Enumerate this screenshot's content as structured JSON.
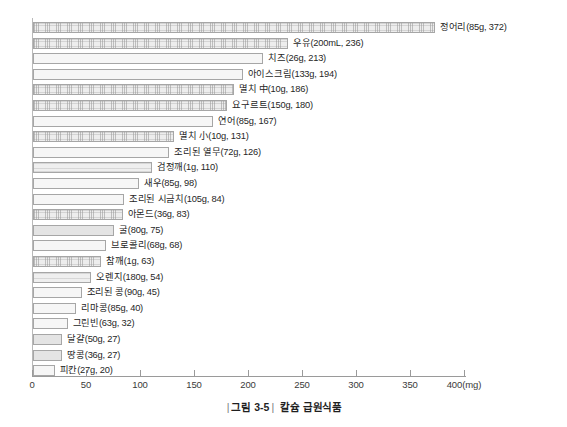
{
  "caption": {
    "left_rule": "|",
    "figure_number": "그림 3-5",
    "right_rule": "|",
    "title": "칼슘 급원식품"
  },
  "axis": {
    "unit_suffix": "(mg)",
    "ticks": [
      "0",
      "50",
      "100",
      "150",
      "200",
      "250",
      "300",
      "350",
      "400(mg)"
    ]
  },
  "chart_data": {
    "type": "bar",
    "orientation": "horizontal",
    "title": "칼슘 급원식품",
    "xlabel": "(mg)",
    "ylabel": "",
    "xlim": [
      0,
      400
    ],
    "grid": false,
    "legend": "none",
    "xticks": [
      0,
      50,
      100,
      150,
      200,
      250,
      300,
      350,
      400
    ],
    "categories": [
      "정어리",
      "우유",
      "치즈",
      "아이스크림",
      "멸치 中",
      "요구르트",
      "연어",
      "멸치 小",
      "조리된 열무",
      "검정깨",
      "새우",
      "조리된 시금치",
      "아몬드",
      "굴",
      "브로콜리",
      "참깨",
      "오렌지",
      "조리된 콩",
      "리마콩",
      "그린빈",
      "달걀",
      "땅콩",
      "피칸"
    ],
    "values": [
      372,
      236,
      213,
      194,
      186,
      180,
      167,
      131,
      126,
      110,
      98,
      84,
      83,
      75,
      68,
      63,
      54,
      45,
      40,
      32,
      27,
      27,
      20
    ],
    "serving_sizes": [
      "85g",
      "200mL",
      "26g",
      "133g",
      "10g",
      "150g",
      "85g",
      "10g",
      "72g",
      "1g",
      "85g",
      "105g",
      "36g",
      "80g",
      "68g",
      "1g",
      "180g",
      "90g",
      "85g",
      "63g",
      "50g",
      "36g",
      "27g"
    ],
    "labels": [
      "정어리(85g, 372)",
      "우유(200mL, 236)",
      "치즈(26g, 213)",
      "아이스크림(133g, 194)",
      "멸치 中(10g, 186)",
      "요구르트(150g, 180)",
      "연어(85g, 167)",
      "멸치 小(10g, 131)",
      "조리된 열무(72g, 126)",
      "검정깨(1g, 110)",
      "새우(85g, 98)",
      "조리된 시금치(105g, 84)",
      "아몬드(36g, 83)",
      "굴(80g, 75)",
      "브로콜리(68g, 68)",
      "참깨(1g, 63)",
      "오렌지(180g, 54)",
      "조리된 콩(90g, 45)",
      "리마콩(85g, 40)",
      "그린빈(63g, 32)",
      "달걀(50g, 27)",
      "땅콩(36g, 27)",
      "피칸(27g, 20)"
    ],
    "bar_patterns": [
      "hatch",
      "hatch",
      "plain",
      "plain",
      "hatch",
      "hatch",
      "plain",
      "hatch",
      "plain",
      "band",
      "plain",
      "plain",
      "hatch",
      "solid",
      "plain",
      "hatch",
      "band",
      "plain",
      "plain",
      "plain",
      "solid",
      "solid",
      "plain"
    ],
    "colors": {
      "bar_fill": "#f2f2f2",
      "bar_border": "#a6a6a6",
      "axis": "#9a9a9a",
      "text": "#262626"
    }
  }
}
